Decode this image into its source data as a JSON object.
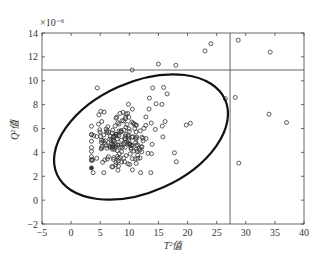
{
  "chart_data": {
    "type": "scatter",
    "title": "",
    "xlabel": "T²值",
    "ylabel": "Q²值",
    "y_scale_annotation": "×10⁻⁶",
    "xlim": [
      -5,
      40
    ],
    "ylim": [
      -2,
      14
    ],
    "x_ticks": [
      -5,
      0,
      5,
      10,
      15,
      20,
      25,
      30,
      35,
      40
    ],
    "y_ticks": [
      -2,
      0,
      2,
      4,
      6,
      8,
      10,
      12,
      14
    ],
    "grid": false,
    "legend": null,
    "control_limits": {
      "T2_limit_vertical_line": 27.3,
      "Q_limit_horizontal_line": 10.9
    },
    "confidence_ellipse": {
      "center": [
        12.0,
        5.8
      ],
      "description": "tilted ellipse enclosing the normal-operation cluster; spans T² ≈ -2.5 to 27, Q ≈ 0 to 9.7"
    },
    "outliers": [
      {
        "x": 4.5,
        "y": 9.4
      },
      {
        "x": 10.5,
        "y": 10.9
      },
      {
        "x": 15,
        "y": 11.4
      },
      {
        "x": 18,
        "y": 11.3
      },
      {
        "x": 23,
        "y": 12.5
      },
      {
        "x": 24,
        "y": 13.1
      },
      {
        "x": 28.7,
        "y": 13.4
      },
      {
        "x": 34.2,
        "y": 12.4
      },
      {
        "x": 28.2,
        "y": 8.6
      },
      {
        "x": 34,
        "y": 7.2
      },
      {
        "x": 37,
        "y": 6.5
      },
      {
        "x": 28.8,
        "y": 3.1
      },
      {
        "x": 26.5,
        "y": 8.5
      },
      {
        "x": 14,
        "y": 9.4
      },
      {
        "x": 16.5,
        "y": 8.9
      }
    ],
    "cluster": {
      "approx_center": [
        9,
        5
      ],
      "approx_count": 200,
      "x_range": [
        3.5,
        25
      ],
      "y_range": [
        2.3,
        9.5
      ]
    }
  }
}
